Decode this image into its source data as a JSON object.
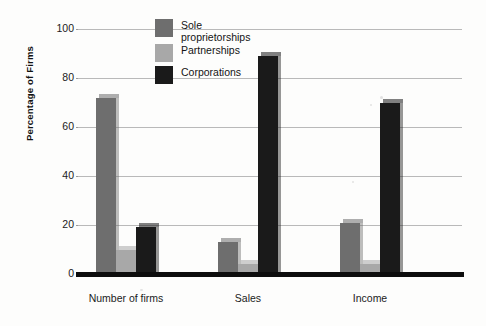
{
  "chart_data": {
    "type": "bar",
    "title": "",
    "xlabel": "",
    "ylabel": "Percentage of Firms",
    "ylim": [
      0,
      100
    ],
    "yticks": [
      0,
      20,
      40,
      60,
      80,
      100
    ],
    "grid": true,
    "legend_position": "top-center",
    "categories": [
      "Number of firms",
      "Sales",
      "Income"
    ],
    "series": [
      {
        "name": "Sole proprietorships",
        "color": "#6e6e6e",
        "values": [
          72,
          13,
          21
        ]
      },
      {
        "name": "Partnerships",
        "color": "#a8a8a8",
        "values": [
          10,
          4,
          4
        ]
      },
      {
        "name": "Corporations",
        "color": "#1a1a1a",
        "values": [
          19,
          89,
          70
        ]
      }
    ]
  },
  "axis": {
    "y_title": "Percentage of Firms",
    "tick_labels": [
      "100",
      "80",
      "60",
      "40",
      "20",
      "0"
    ],
    "category_labels": [
      "Number of firms",
      "Sales",
      "Income"
    ]
  },
  "legend": {
    "items": [
      {
        "label": "Sole\nproprietorships",
        "swatch": "#6e6e6e"
      },
      {
        "label": "Partnerships",
        "swatch": "#a8a8a8"
      },
      {
        "label": "Corporations",
        "swatch": "#1a1a1a"
      }
    ]
  }
}
